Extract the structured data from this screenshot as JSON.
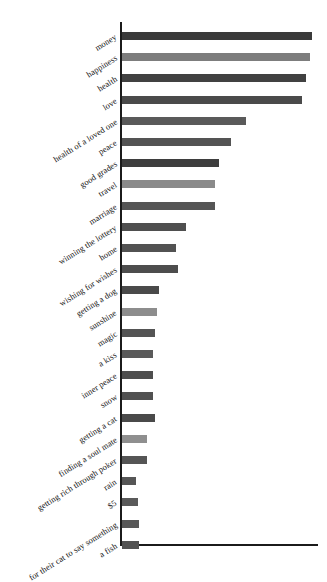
{
  "chart_data": {
    "type": "bar",
    "orientation": "horizontal",
    "title": "",
    "subtitle": "",
    "xlabel": "",
    "ylabel": "",
    "grid": false,
    "legend": false,
    "axis": {
      "x_ticks": [],
      "y_ticks_are_categories": true,
      "xlim": [
        0,
        100
      ]
    },
    "categories": [
      "money",
      "happiness",
      "health",
      "love",
      "health of a loved one",
      "peace",
      "good grades",
      "travel",
      "marriage",
      "winning the lottery",
      "home",
      "wishing for wishes",
      "getting a dog",
      "sunshine",
      "magic",
      "a kiss",
      "inner peace",
      "snow",
      "getting a cat",
      "finding a soul mate",
      "getting rich through poker",
      "rain",
      "$5",
      "for their cat to say something",
      "a fish"
    ],
    "values": [
      98,
      97,
      95,
      93,
      64,
      56,
      50,
      48,
      48,
      33,
      28,
      29,
      19,
      18,
      17,
      16,
      16,
      16,
      17,
      13,
      13,
      7,
      8,
      9,
      9
    ],
    "bar_colors": [
      "#3a3a3a",
      "#7d7d7d",
      "#414141",
      "#4a4a4a",
      "#5a5a5a",
      "#545454",
      "#3e3e3e",
      "#8a8a8a",
      "#555555",
      "#4f4f4f",
      "#525252",
      "#4d4d4d",
      "#4a4a4a",
      "#8d8d8d",
      "#545454",
      "#5a5a5a",
      "#4e4e4e",
      "#515151",
      "#4a4a4a",
      "#8f8f8f",
      "#555555",
      "#565656",
      "#5a5a5a",
      "#585858",
      "#525252"
    ],
    "axis_color": "#1b1b1b"
  }
}
